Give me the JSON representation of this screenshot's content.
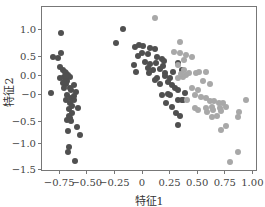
{
  "chart_data": {
    "type": "scatter",
    "title": "",
    "xlabel": "特征1",
    "ylabel": "特征2",
    "xlim": [
      -0.85,
      1.04
    ],
    "ylim": [
      -1.55,
      1.5
    ],
    "grid": false,
    "legend": null,
    "xticks": [
      {
        "label": "−0.75",
        "value": -0.75
      },
      {
        "label": "−0.50",
        "value": -0.5
      },
      {
        "label": "−0.25",
        "value": -0.25
      },
      {
        "label": "0",
        "value": 0
      },
      {
        "label": "0.25",
        "value": 0.25
      },
      {
        "label": "0.50",
        "value": 0.5
      },
      {
        "label": "0.75",
        "value": 0.75
      },
      {
        "label": "1.00",
        "value": 1.0
      }
    ],
    "yticks": [
      {
        "label": "1.0",
        "value": 1.0
      },
      {
        "label": "0.5",
        "value": 0.5
      },
      {
        "label": "0.0",
        "value": 0.0
      },
      {
        "label": "−0",
        "value": -0.25
      },
      {
        "label": "−0.5",
        "value": -0.5
      },
      {
        "label": "−1.0",
        "value": -1.0
      },
      {
        "label": "−1.5",
        "value": -1.5
      }
    ],
    "series": [
      {
        "name": "cluster-dark",
        "color": "#505050",
        "points": [
          [
            -0.73,
            0.91
          ],
          [
            -0.81,
            0.39
          ],
          [
            -0.73,
            0.48
          ],
          [
            -0.76,
            0.37
          ],
          [
            -0.82,
            -0.39
          ],
          [
            -0.74,
            0.17
          ],
          [
            -0.72,
            0.11
          ],
          [
            -0.7,
            0.07
          ],
          [
            -0.69,
            0.04
          ],
          [
            -0.71,
            -0.04
          ],
          [
            -0.74,
            -0.07
          ],
          [
            -0.69,
            -0.09
          ],
          [
            -0.67,
            0.0
          ],
          [
            -0.68,
            -0.13
          ],
          [
            -0.65,
            -0.04
          ],
          [
            -0.72,
            -0.17
          ],
          [
            -0.69,
            -0.2
          ],
          [
            -0.62,
            -0.22
          ],
          [
            -0.64,
            -0.33
          ],
          [
            -0.71,
            -0.28
          ],
          [
            -0.6,
            -0.37
          ],
          [
            -0.68,
            -0.43
          ],
          [
            -0.64,
            -0.5
          ],
          [
            -0.62,
            -0.54
          ],
          [
            -0.65,
            -0.61
          ],
          [
            -0.58,
            -0.72
          ],
          [
            -0.66,
            -0.74
          ],
          [
            -0.63,
            -0.83
          ],
          [
            -0.66,
            -0.89
          ],
          [
            -0.68,
            -0.98
          ],
          [
            -0.64,
            -1.0
          ],
          [
            -0.59,
            -1.13
          ],
          [
            -0.67,
            -1.22
          ],
          [
            -0.56,
            -1.3
          ],
          [
            -0.66,
            -1.57
          ],
          [
            -0.67,
            -1.67
          ],
          [
            -0.61,
            -1.87
          ],
          [
            -0.69,
            -0.02
          ],
          [
            -0.71,
            -0.15
          ],
          [
            -0.65,
            -0.28
          ],
          [
            -0.62,
            -0.46
          ],
          [
            -0.69,
            -0.54
          ],
          [
            -0.63,
            -0.67
          ],
          [
            -0.65,
            -0.93
          ],
          [
            -0.14,
            1.54
          ],
          [
            -0.17,
            1.0
          ],
          [
            -0.24,
            0.7
          ],
          [
            -0.06,
            0.61
          ],
          [
            -0.03,
            0.65
          ],
          [
            0.01,
            0.63
          ],
          [
            0.07,
            0.59
          ],
          [
            0.12,
            0.57
          ],
          [
            0.0,
            0.48
          ],
          [
            0.05,
            0.46
          ],
          [
            -0.04,
            0.41
          ],
          [
            0.14,
            0.39
          ],
          [
            0.18,
            0.35
          ],
          [
            0.2,
            0.3
          ],
          [
            0.03,
            0.28
          ],
          [
            0.07,
            0.24
          ],
          [
            0.13,
            0.26
          ],
          [
            -0.07,
            0.22
          ],
          [
            0.05,
            0.15
          ],
          [
            0.1,
            0.11
          ],
          [
            -0.05,
            0.07
          ],
          [
            0.06,
            0.04
          ],
          [
            0.16,
            0.13
          ],
          [
            0.21,
            0.04
          ],
          [
            0.19,
            0.2
          ],
          [
            0.14,
            -0.07
          ],
          [
            0.12,
            -0.11
          ],
          [
            0.21,
            -0.02
          ],
          [
            0.25,
            -0.07
          ],
          [
            0.24,
            -0.15
          ],
          [
            0.16,
            -0.2
          ],
          [
            0.27,
            -0.22
          ],
          [
            0.3,
            -0.28
          ],
          [
            0.18,
            -0.43
          ],
          [
            0.25,
            -0.43
          ],
          [
            0.33,
            -0.54
          ],
          [
            0.22,
            -0.61
          ],
          [
            0.27,
            -0.7
          ],
          [
            0.31,
            -0.83
          ],
          [
            0.36,
            -0.54
          ],
          [
            0.24,
            -0.41
          ],
          [
            0.33,
            -0.33
          ],
          [
            0.34,
            -0.89
          ],
          [
            0.33,
            -1.09
          ],
          [
            0.37,
            -0.54
          ],
          [
            0.39,
            -0.39
          ],
          [
            0.33,
            0.26
          ],
          [
            0.36,
            0.11
          ],
          [
            0.28,
            0.07
          ]
        ]
      },
      {
        "name": "cluster-light",
        "color": "#a8a8a8",
        "points": [
          [
            0.12,
            1.24
          ],
          [
            0.34,
            0.72
          ],
          [
            0.29,
            0.5
          ],
          [
            0.34,
            0.48
          ],
          [
            0.4,
            0.43
          ],
          [
            0.45,
            0.39
          ],
          [
            0.38,
            0.33
          ],
          [
            0.33,
            0.22
          ],
          [
            0.4,
            0.0
          ],
          [
            0.37,
            -0.04
          ],
          [
            0.33,
            -0.07
          ],
          [
            0.43,
            0.04
          ],
          [
            0.49,
            0.04
          ],
          [
            0.52,
            0.07
          ],
          [
            0.58,
            0.07
          ],
          [
            0.55,
            -0.13
          ],
          [
            0.62,
            -0.2
          ],
          [
            0.45,
            -0.28
          ],
          [
            0.51,
            -0.33
          ],
          [
            0.48,
            -0.43
          ],
          [
            0.53,
            -0.48
          ],
          [
            0.58,
            -0.5
          ],
          [
            0.62,
            -0.57
          ],
          [
            0.65,
            -0.57
          ],
          [
            0.7,
            -0.61
          ],
          [
            0.73,
            -0.61
          ],
          [
            0.63,
            -0.7
          ],
          [
            0.58,
            -0.72
          ],
          [
            0.51,
            -0.76
          ],
          [
            0.48,
            -0.72
          ],
          [
            0.41,
            -0.54
          ],
          [
            0.68,
            -0.89
          ],
          [
            0.72,
            -0.78
          ],
          [
            0.76,
            -0.7
          ],
          [
            0.63,
            -0.91
          ],
          [
            0.59,
            -0.8
          ],
          [
            0.71,
            -0.72
          ],
          [
            0.94,
            -0.54
          ],
          [
            0.88,
            -0.8
          ],
          [
            0.87,
            -0.91
          ],
          [
            0.76,
            -1.11
          ],
          [
            0.72,
            -1.2
          ],
          [
            0.87,
            -1.67
          ],
          [
            0.8,
            -1.89
          ],
          [
            0.38,
            0.11
          ],
          [
            0.35,
            0.02
          ],
          [
            0.64,
            -0.76
          ]
        ]
      }
    ]
  }
}
